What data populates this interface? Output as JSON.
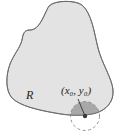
{
  "figure": {
    "region_label": "R",
    "point_label": "(x₀, y₀)",
    "colors": {
      "region_fill": "#e3e3e3",
      "region_stroke": "#6a6a6a",
      "disk_fill": "#a8a8a8",
      "point": "#3a3a3a",
      "dashed_circle": "#888888"
    }
  }
}
